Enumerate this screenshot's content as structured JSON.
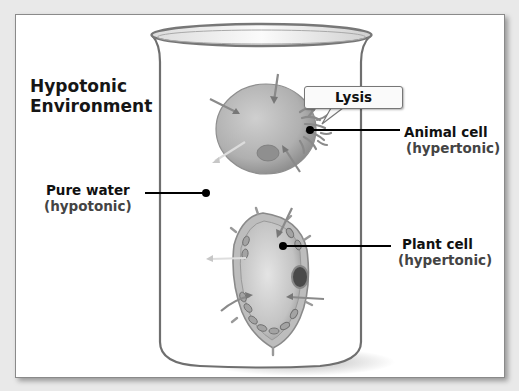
{
  "diagram": {
    "title_line1": "Hypotonic",
    "title_line2": "Environment",
    "labels": {
      "pure_water": "Pure water",
      "pure_water_sub": "(hypotonic)",
      "lysis": "Lysis",
      "animal_cell": "Animal cell",
      "animal_cell_sub": "(hypertonic)",
      "plant_cell": "Plant cell",
      "plant_cell_sub": "(hypertonic)"
    },
    "colors": {
      "background": "#e9e9e9",
      "panel": "#ffffff",
      "beaker_outline": "#6f6f6f",
      "cell_fill": "#b5b5b5",
      "leader_line": "#000000"
    }
  }
}
